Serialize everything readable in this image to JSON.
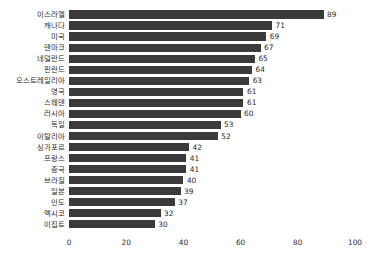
{
  "chart_data": {
    "type": "bar",
    "orientation": "horizontal",
    "title": "",
    "subtitle": "",
    "xlabel": "",
    "ylabel": "",
    "xlim": [
      0,
      100
    ],
    "xticks": [
      "0",
      "20",
      "40",
      "60",
      "80",
      "100"
    ],
    "grid": false,
    "legend": null,
    "bar_color": "#3a3a3a",
    "text_color": "#2b2b2b",
    "background": "#ffffff",
    "show_value_labels": true,
    "categories": [
      "이스라엘",
      "캐나다",
      "미국",
      "덴마크",
      "네덜란드",
      "핀란드",
      "오스트레일리아",
      "영국",
      "스웨덴",
      "러시아",
      "독일",
      "이탈리아",
      "싱가포르",
      "프랑스",
      "중국",
      "브라질",
      "일본",
      "인도",
      "멕시코",
      "이집트"
    ],
    "values": [
      89,
      71,
      69,
      67,
      65,
      64,
      63,
      61,
      61,
      60,
      53,
      52,
      42,
      41,
      41,
      40,
      39,
      37,
      32,
      30
    ],
    "value_labels": [
      "89",
      "71",
      "69",
      "67",
      "65",
      "64",
      "63",
      "61",
      "61",
      "60",
      "53",
      "52",
      "42",
      "41",
      "41",
      "40",
      "39",
      "37",
      "32",
      "30"
    ]
  }
}
